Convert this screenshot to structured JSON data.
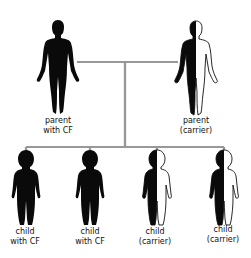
{
  "diagram": {
    "colors": {
      "affected": "#0a0a0a",
      "unaffected": "#ffffff",
      "outline": "#111111",
      "connector": "#555555"
    },
    "parents": [
      {
        "id": "parent-with-cf",
        "status": "affected",
        "kind": "adult",
        "label_lines": [
          "parent",
          "with CF"
        ]
      },
      {
        "id": "parent-carrier",
        "status": "carrier",
        "kind": "adult",
        "label_lines": [
          "parent",
          "(carrier)"
        ]
      }
    ],
    "children": [
      {
        "id": "child-1",
        "status": "affected",
        "kind": "child",
        "label_lines": [
          "child",
          "with CF"
        ]
      },
      {
        "id": "child-2",
        "status": "affected",
        "kind": "child",
        "label_lines": [
          "child",
          "with CF"
        ]
      },
      {
        "id": "child-3",
        "status": "carrier",
        "kind": "child",
        "label_lines": [
          "child",
          "(carrier)"
        ]
      },
      {
        "id": "child-4",
        "status": "carrier",
        "kind": "child",
        "label_lines": [
          "child",
          "(carrier)"
        ]
      }
    ]
  }
}
